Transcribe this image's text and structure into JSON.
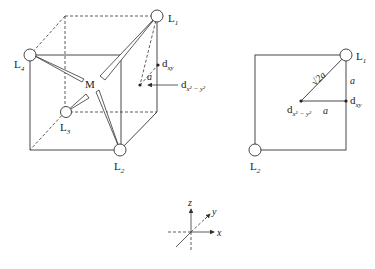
{
  "figure": {
    "cube_view": {
      "metal_label": "M",
      "ligands": [
        {
          "label": "L",
          "sub": "1"
        },
        {
          "label": "L",
          "sub": "2"
        },
        {
          "label": "L",
          "sub": "3"
        },
        {
          "label": "L",
          "sub": "4"
        }
      ],
      "orbital_points": {
        "dxy": {
          "label": "d",
          "sub": "xy"
        },
        "dx2y2": {
          "label": "d",
          "sub": "x² − y²"
        }
      },
      "angle_label": "a"
    },
    "square_view": {
      "ligands": [
        {
          "label": "L",
          "sub": "1"
        },
        {
          "label": "L",
          "sub": "2"
        }
      ],
      "orbital_points": {
        "dxy": {
          "label": "d",
          "sub": "xy"
        },
        "dx2y2": {
          "label": "d",
          "sub": "x² − y²"
        }
      },
      "diagonal_label": "√2a",
      "vertical_label": "a",
      "horizontal_label": "a"
    },
    "axes": {
      "x": "x",
      "y": "y",
      "z": "z"
    }
  }
}
